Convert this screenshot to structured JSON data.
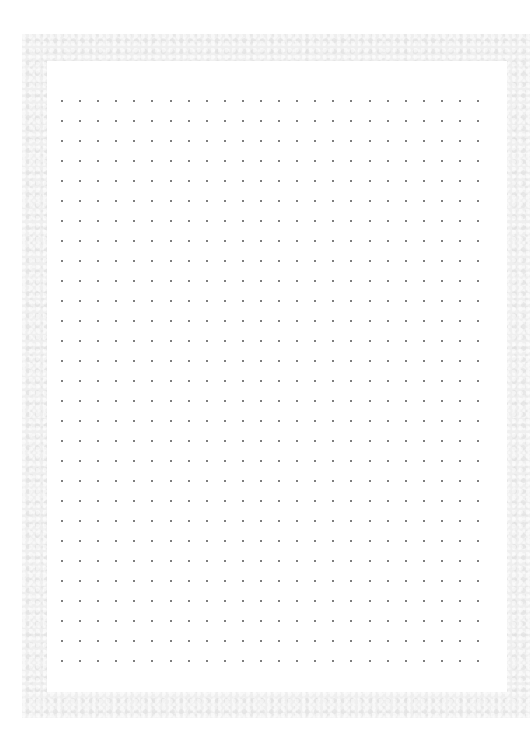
{
  "page": {
    "type": "dot-grid-paper",
    "background_color": "#ffffff",
    "border_color": "#efefef",
    "sheet_color": "#ffffff",
    "dot_color": "#555555"
  },
  "dot_grid": {
    "columns": 24,
    "rows": 29,
    "origin_x": 62,
    "origin_y": 101,
    "spacing_x": 18.09,
    "spacing_y": 20.0,
    "dot_size": 2
  }
}
